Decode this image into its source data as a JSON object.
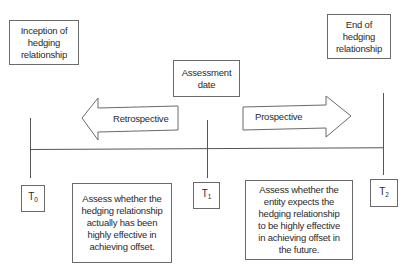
{
  "diagram": {
    "boxes": {
      "inception": "Inception of hedging relationship",
      "end": "End of hedging relationship",
      "assessment_date": "Assessment date"
    },
    "arrows": {
      "retrospective": "Retrospective",
      "prospective": "Prospective"
    },
    "time_points": [
      {
        "base": "T",
        "sub": "0"
      },
      {
        "base": "T",
        "sub": "1"
      },
      {
        "base": "T",
        "sub": "2"
      }
    ],
    "descriptions": {
      "retrospective": "Assess whether the hedging relationship actually has been highly effective in achieving offset.",
      "prospective": "Assess whether the entity expects the hedging relationship to be highly effective in achieving offset in the future."
    },
    "colors": {
      "line": "#555555",
      "border": "#6a6a6a",
      "text": "#2a2a2a"
    }
  }
}
